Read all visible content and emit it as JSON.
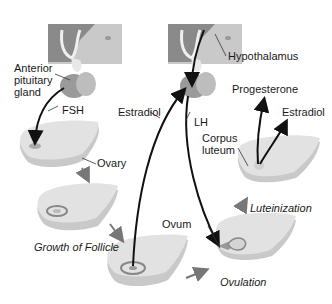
{
  "diagram": {
    "title": "",
    "nodes": {
      "hypothalamus": "Hypothalamus",
      "anterior_pituitary": [
        "Anterior",
        "pituitary",
        "gland"
      ],
      "ovary": "Ovary",
      "corpus_luteum": [
        "Corpus",
        "luteum"
      ],
      "ovum": "Ovum"
    },
    "hormones": {
      "fsh": "FSH",
      "lh": "LH",
      "estradiol_feedback": "Estradiol",
      "progesterone": "Progesterone",
      "estradiol_output": "Estradiol"
    },
    "stages": {
      "growth": "Growth of Follicle",
      "ovulation": "Ovulation",
      "luteinization": "Luteinization"
    },
    "colors": {
      "brain_dark": "#8c8c8c",
      "brain_light": "#c8c8c8",
      "pituitary": "#9a9a9a",
      "ovary_top": "#e2e2e2",
      "ovary_side": "#c9c9c9",
      "arrow": "#111111",
      "stage_arrow": "#777777"
    }
  }
}
